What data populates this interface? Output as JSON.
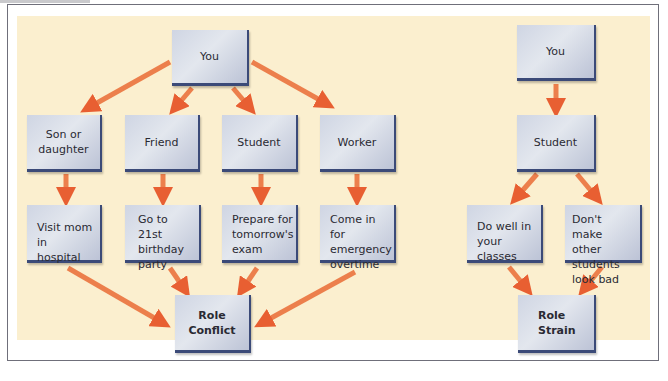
{
  "colors": {
    "panel_bg": "#fbefcf",
    "box_fill": "#d6dbe6",
    "box_edge": "#3b4a78",
    "arrow": "#e8582a",
    "frame": "#6f6f7a"
  },
  "role_conflict_diagram": {
    "root": "You",
    "roles": [
      {
        "label": "Son or daughter",
        "expectation": "Visit mom in hospital"
      },
      {
        "label": "Friend",
        "expectation": "Go to 21st birthday party"
      },
      {
        "label": "Student",
        "expectation": "Prepare for tomorrow's exam"
      },
      {
        "label": "Worker",
        "expectation": "Come in for emergency overtime"
      }
    ],
    "result": "Role Conflict"
  },
  "role_strain_diagram": {
    "root": "You",
    "role": "Student",
    "expectations": [
      "Do well in your classes",
      "Don't make other students look bad"
    ],
    "result": "Role Strain"
  }
}
